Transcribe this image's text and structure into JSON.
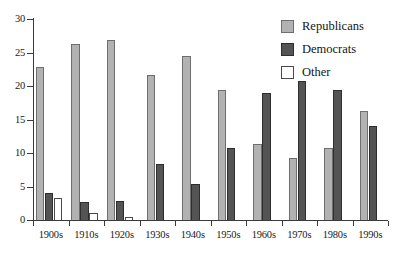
{
  "chart_data": {
    "type": "bar",
    "title": "",
    "subtitle": "",
    "xlabel": "",
    "ylabel": "",
    "ylim": [
      0,
      30
    ],
    "yticks": [
      0,
      5,
      10,
      15,
      20,
      25,
      30
    ],
    "ytick_labels": [
      "0",
      "5",
      "10",
      "15",
      "20",
      "25",
      "30"
    ],
    "grid": false,
    "legend_position": "top-right",
    "categories": [
      "1900s",
      "1910s",
      "1920s",
      "1930s",
      "1940s",
      "1950s",
      "1960s",
      "1970s",
      "1980s",
      "1990s"
    ],
    "series": [
      {
        "name": "Republicans",
        "color": "#b2b2b2",
        "values": [
          22.9,
          26.3,
          26.8,
          21.6,
          24.5,
          19.4,
          11.4,
          9.3,
          10.8,
          16.2
        ]
      },
      {
        "name": "Democrats",
        "color": "#545454",
        "values": [
          4.0,
          2.7,
          2.8,
          8.4,
          5.4,
          10.8,
          19.0,
          20.7,
          19.4,
          14.0
        ]
      },
      {
        "name": "Other",
        "color": "#ffffff",
        "values": [
          3.3,
          1.0,
          0.4,
          0,
          0,
          0,
          0,
          0,
          0,
          0
        ]
      }
    ]
  },
  "legend": {
    "items": [
      {
        "label": "Republicans",
        "swatch": "rep"
      },
      {
        "label": "Democrats",
        "swatch": "dem"
      },
      {
        "label": "Other",
        "swatch": "oth"
      }
    ]
  }
}
